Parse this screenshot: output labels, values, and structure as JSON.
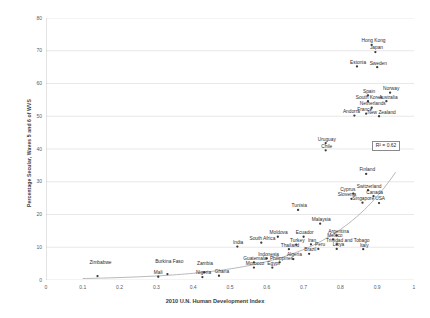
{
  "chart_data": {
    "type": "scatter",
    "title": "",
    "xlabel": "2010 U.N. Human Development Index",
    "ylabel": "Percentage Secular, Waves 5 and 6 of WVS",
    "xlim": [
      0,
      1
    ],
    "ylim": [
      0,
      80
    ],
    "xticks": [
      "0",
      "0.1",
      "0.2",
      "0.3",
      "0.4",
      "0.5",
      "0.6",
      "0.7",
      "0.8",
      "0.9",
      "1"
    ],
    "xtick_values": [
      0,
      0.1,
      0.2,
      0.3,
      0.4,
      0.5,
      0.6,
      0.7,
      0.8,
      0.9,
      1
    ],
    "yticks": [
      "0",
      "10",
      "20",
      "30",
      "40",
      "50",
      "60",
      "70",
      "80"
    ],
    "ytick_values": [
      0,
      10,
      20,
      30,
      40,
      50,
      60,
      70,
      80
    ],
    "grid": "horizontal",
    "legend": "none",
    "annotation": "R² = 0.62",
    "r_squared": 0.62,
    "trendline": {
      "visible": true,
      "style": "exponential-curve",
      "color": "#9a9a9a"
    },
    "marker_color": "#3a3a3a",
    "gridline_color": "#d9d9d9",
    "points": [
      {
        "label": "Zimbabwe",
        "x": 0.14,
        "y": 1.2,
        "lx": 0.148,
        "ly": 4.2,
        "align": "center"
      },
      {
        "label": "Mali",
        "x": 0.305,
        "y": 1.0,
        "lx": 0.305,
        "ly": 1.0,
        "align": "center"
      },
      {
        "label": "Burkina Faso",
        "x": 0.33,
        "y": 1.8,
        "lx": 0.335,
        "ly": 4.4,
        "align": "center"
      },
      {
        "label": "Nigeria",
        "x": 0.425,
        "y": 0.9,
        "lx": 0.428,
        "ly": 0.9,
        "align": "center"
      },
      {
        "label": "Zambia",
        "x": 0.43,
        "y": 2.4,
        "lx": 0.432,
        "ly": 3.9,
        "align": "center"
      },
      {
        "label": "Ghana",
        "x": 0.47,
        "y": 1.3,
        "lx": 0.478,
        "ly": 1.3,
        "align": "center"
      },
      {
        "label": "Morocco",
        "x": 0.565,
        "y": 3.8,
        "lx": 0.568,
        "ly": 3.8,
        "align": "center"
      },
      {
        "label": "Egypt",
        "x": 0.615,
        "y": 3.8,
        "lx": 0.618,
        "ly": 3.8,
        "align": "center"
      },
      {
        "label": "Guatemala",
        "x": 0.565,
        "y": 5.4,
        "lx": 0.568,
        "ly": 5.4,
        "align": "center"
      },
      {
        "label": "Philippines",
        "x": 0.635,
        "y": 5.4,
        "lx": 0.64,
        "ly": 5.4,
        "align": "center"
      },
      {
        "label": "Indonesia",
        "x": 0.6,
        "y": 6.6,
        "lx": 0.605,
        "ly": 6.6,
        "align": "center"
      },
      {
        "label": "Algeria",
        "x": 0.672,
        "y": 6.4,
        "lx": 0.675,
        "ly": 6.4,
        "align": "center"
      },
      {
        "label": "Brazil",
        "x": 0.715,
        "y": 8.0,
        "lx": 0.718,
        "ly": 8.0,
        "align": "center"
      },
      {
        "label": "India",
        "x": 0.52,
        "y": 10.2,
        "lx": 0.522,
        "ly": 10.2,
        "align": "center"
      },
      {
        "label": "Thailand",
        "x": 0.66,
        "y": 9.4,
        "lx": 0.663,
        "ly": 9.4,
        "align": "center"
      },
      {
        "label": "Peru",
        "x": 0.74,
        "y": 9.5,
        "lx": 0.745,
        "ly": 9.5,
        "align": "center"
      },
      {
        "label": "Libya",
        "x": 0.79,
        "y": 9.5,
        "lx": 0.795,
        "ly": 9.5,
        "align": "center"
      },
      {
        "label": "South Africa",
        "x": 0.585,
        "y": 11.4,
        "lx": 0.588,
        "ly": 11.4,
        "align": "center"
      },
      {
        "label": "Turkey",
        "x": 0.68,
        "y": 10.8,
        "lx": 0.683,
        "ly": 10.8,
        "align": "center"
      },
      {
        "label": "Iran",
        "x": 0.72,
        "y": 10.9,
        "lx": 0.723,
        "ly": 10.9,
        "align": "center"
      },
      {
        "label": "Trinidad and Tobago",
        "x": 0.79,
        "y": 10.9,
        "lx": 0.82,
        "ly": 10.9,
        "align": "center"
      },
      {
        "label": "Moldova",
        "x": 0.63,
        "y": 13.2,
        "lx": 0.632,
        "ly": 13.2,
        "align": "center"
      },
      {
        "label": "Ecuador",
        "x": 0.7,
        "y": 13.2,
        "lx": 0.703,
        "ly": 13.2,
        "align": "center"
      },
      {
        "label": "Argentina",
        "x": 0.79,
        "y": 13.6,
        "lx": 0.795,
        "ly": 13.6,
        "align": "center"
      },
      {
        "label": "Mexico",
        "x": 0.78,
        "y": 12.4,
        "lx": 0.785,
        "ly": 12.4,
        "align": "center"
      },
      {
        "label": "Italy",
        "x": 0.862,
        "y": 9.4,
        "lx": 0.865,
        "ly": 9.4,
        "align": "center"
      },
      {
        "label": "Malaysia",
        "x": 0.745,
        "y": 17.2,
        "lx": 0.748,
        "ly": 17.2,
        "align": "center"
      },
      {
        "label": "Tunisia",
        "x": 0.685,
        "y": 21.4,
        "lx": 0.688,
        "ly": 21.4,
        "align": "center"
      },
      {
        "label": "Slovenia",
        "x": 0.83,
        "y": 24.8,
        "lx": 0.818,
        "ly": 24.8,
        "align": "center"
      },
      {
        "label": "Cyprus",
        "x": 0.835,
        "y": 26.4,
        "lx": 0.82,
        "ly": 26.4,
        "align": "center"
      },
      {
        "label": "Singapore",
        "x": 0.86,
        "y": 23.6,
        "lx": 0.862,
        "ly": 23.6,
        "align": "center"
      },
      {
        "label": "USA",
        "x": 0.905,
        "y": 23.5,
        "lx": 0.908,
        "ly": 23.5,
        "align": "center"
      },
      {
        "label": "Canada",
        "x": 0.89,
        "y": 25.6,
        "lx": 0.893,
        "ly": 25.6,
        "align": "center"
      },
      {
        "label": "Switzerland",
        "x": 0.875,
        "y": 27.4,
        "lx": 0.878,
        "ly": 27.4,
        "align": "center"
      },
      {
        "label": "Finland",
        "x": 0.87,
        "y": 32.4,
        "lx": 0.873,
        "ly": 32.4,
        "align": "center"
      },
      {
        "label": "Uruguay",
        "x": 0.76,
        "y": 41.8,
        "lx": 0.763,
        "ly": 41.8,
        "align": "center"
      },
      {
        "label": "Chile",
        "x": 0.76,
        "y": 39.6,
        "lx": 0.763,
        "ly": 39.6,
        "align": "center"
      },
      {
        "label": "Andorra",
        "x": 0.838,
        "y": 50.2,
        "lx": 0.83,
        "ly": 50.2,
        "align": "center"
      },
      {
        "label": "France",
        "x": 0.87,
        "y": 50.8,
        "lx": 0.866,
        "ly": 50.8,
        "align": "center"
      },
      {
        "label": "New Zealand",
        "x": 0.905,
        "y": 50.0,
        "lx": 0.912,
        "ly": 50.0,
        "align": "center"
      },
      {
        "label": "Netherlands",
        "x": 0.885,
        "y": 52.6,
        "lx": 0.888,
        "ly": 52.6,
        "align": "center"
      },
      {
        "label": "South Korea",
        "x": 0.875,
        "y": 54.6,
        "lx": 0.878,
        "ly": 54.6,
        "align": "center"
      },
      {
        "label": "Australia",
        "x": 0.925,
        "y": 54.6,
        "lx": 0.93,
        "ly": 54.6,
        "align": "center"
      },
      {
        "label": "Spain",
        "x": 0.875,
        "y": 56.4,
        "lx": 0.878,
        "ly": 56.4,
        "align": "center"
      },
      {
        "label": "Norway",
        "x": 0.935,
        "y": 57.2,
        "lx": 0.938,
        "ly": 57.2,
        "align": "center"
      },
      {
        "label": "Estonia",
        "x": 0.845,
        "y": 65.2,
        "lx": 0.848,
        "ly": 65.2,
        "align": "center"
      },
      {
        "label": "Sweden",
        "x": 0.9,
        "y": 65.0,
        "lx": 0.903,
        "ly": 65.0,
        "align": "center"
      },
      {
        "label": "Japan",
        "x": 0.895,
        "y": 69.6,
        "lx": 0.898,
        "ly": 69.6,
        "align": "center"
      },
      {
        "label": "Hong Kong",
        "x": 0.885,
        "y": 71.8,
        "lx": 0.89,
        "ly": 71.8,
        "align": "center"
      }
    ]
  }
}
